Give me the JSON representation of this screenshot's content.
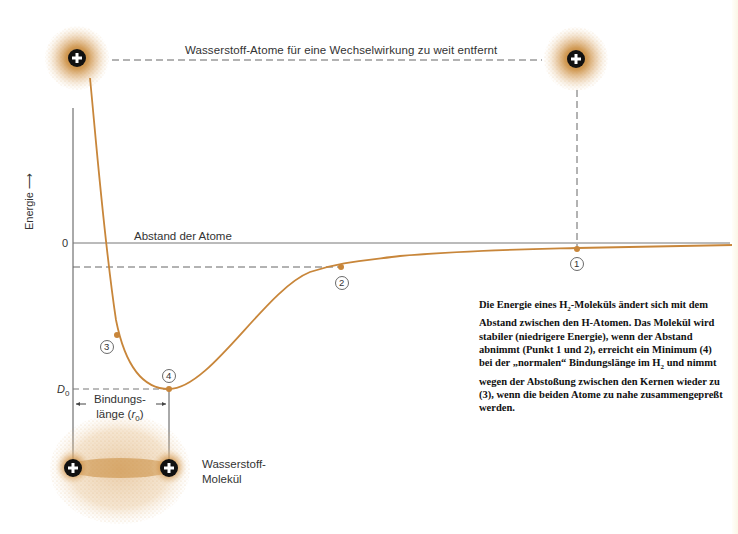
{
  "diagram": {
    "top_label": "Wasserstoff-Atome für eine Wechselwirkung zu weit entfernt",
    "y_axis_label": "Energie",
    "y_axis_arrow": "⟶",
    "zero_label": "0",
    "x_axis_label": "Abstand der Atome",
    "d0_label": "D",
    "d0_sub": "0",
    "bond_length_line1": "Bindungs-",
    "bond_length_line2": "länge (",
    "bond_length_symbol": "r",
    "bond_length_sub": "0",
    "bond_length_close": ")",
    "molecule_label_line1": "Wasserstoff-",
    "molecule_label_line2": "Molekül",
    "points": [
      {
        "id": "1",
        "label": "1"
      },
      {
        "id": "2",
        "label": "2"
      },
      {
        "id": "3",
        "label": "3"
      },
      {
        "id": "4",
        "label": "4"
      }
    ],
    "nucleus_symbol": "+",
    "colors": {
      "curve": "#c8863a",
      "electron_cloud": "#c98a3a",
      "axis": "#555555",
      "dashed": "#555555",
      "nucleus": "#111111"
    }
  },
  "caption": {
    "part1": "Die Energie eines H",
    "sub1": "2",
    "part2": "-Moleküls ändert sich mit dem Abstand zwischen den H-Atomen. Das Molekül wird stabiler (niedrigere Energie), wenn der Abstand abnimmt (Punkt 1 und 2), erreicht ein Minimum (4) bei der „normalen“ Bindungslänge im H",
    "sub2": "2",
    "part3": " und nimmt wegen der Abstoßung zwischen den Kernen wieder zu (3), wenn die beiden Atome zu nahe zusammengepreßt werden."
  }
}
